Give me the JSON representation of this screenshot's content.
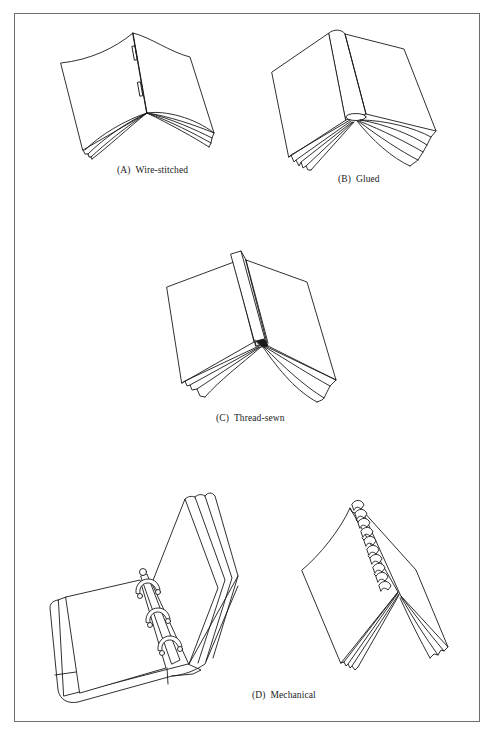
{
  "figure": {
    "panels": [
      {
        "id": "A",
        "tag": "(A)",
        "label": "Wire-stitched",
        "icon": "wire-stitched-book-icon"
      },
      {
        "id": "B",
        "tag": "(B)",
        "label": "Glued",
        "icon": "glued-book-icon"
      },
      {
        "id": "C",
        "tag": "(C)",
        "label": "Thread-sewn",
        "icon": "thread-sewn-book-icon"
      },
      {
        "id": "D",
        "tag": "(D)",
        "label": "Mechanical",
        "icon": "ring-binder-and-spiral-book-icon"
      }
    ],
    "colors": {
      "line": "#1a1a1a",
      "frame": "#6e6e6e",
      "background": "#ffffff"
    }
  }
}
